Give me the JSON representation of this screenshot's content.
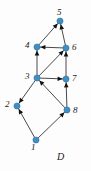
{
  "figure": {
    "caption": "D",
    "width": 91,
    "height": 171,
    "background": "#fdfdfd"
  },
  "style": {
    "node_fill": "#3f8fc4",
    "node_stroke": "#2c6b96",
    "node_radius": 3.1,
    "edge_color": "#4a4a4a",
    "edge_width": 1.0,
    "arrow_color": "#111111",
    "label_color": "#1a1a1a"
  },
  "chart_data": {
    "type": "diagram",
    "title": "D",
    "graph_kind": "directed-graph",
    "nodes": [
      {
        "id": "1",
        "label": "1",
        "x": 36,
        "y": 140,
        "label_x": 31,
        "label_y": 143
      },
      {
        "id": "2",
        "label": "2",
        "x": 17,
        "y": 106,
        "label_x": 5,
        "label_y": 100
      },
      {
        "id": "3",
        "label": "3",
        "x": 37,
        "y": 78,
        "label_x": 25,
        "label_y": 72
      },
      {
        "id": "4",
        "label": "4",
        "x": 37,
        "y": 47,
        "label_x": 25,
        "label_y": 41
      },
      {
        "id": "5",
        "label": "5",
        "x": 60,
        "y": 21,
        "label_x": 57,
        "label_y": 8
      },
      {
        "id": "6",
        "label": "6",
        "x": 66,
        "y": 48,
        "label_x": 72,
        "label_y": 43
      },
      {
        "id": "7",
        "label": "7",
        "x": 66,
        "y": 79,
        "label_x": 72,
        "label_y": 74
      },
      {
        "id": "8",
        "label": "8",
        "x": 67,
        "y": 110,
        "label_x": 73,
        "label_y": 106
      }
    ],
    "edges": [
      {
        "from": "4",
        "to": "5",
        "directed": true
      },
      {
        "from": "6",
        "to": "5",
        "directed": true
      },
      {
        "from": "6",
        "to": "4",
        "directed": true
      },
      {
        "from": "3",
        "to": "4",
        "directed": true
      },
      {
        "from": "3",
        "to": "6",
        "directed": true
      },
      {
        "from": "7",
        "to": "6",
        "directed": true
      },
      {
        "from": "3",
        "to": "7",
        "directed": true
      },
      {
        "from": "8",
        "to": "7",
        "directed": true
      },
      {
        "from": "3",
        "to": "2",
        "directed": true
      },
      {
        "from": "8",
        "to": "3",
        "directed": true
      },
      {
        "from": "1",
        "to": "2",
        "directed": true
      },
      {
        "from": "1",
        "to": "8",
        "directed": true
      }
    ]
  }
}
